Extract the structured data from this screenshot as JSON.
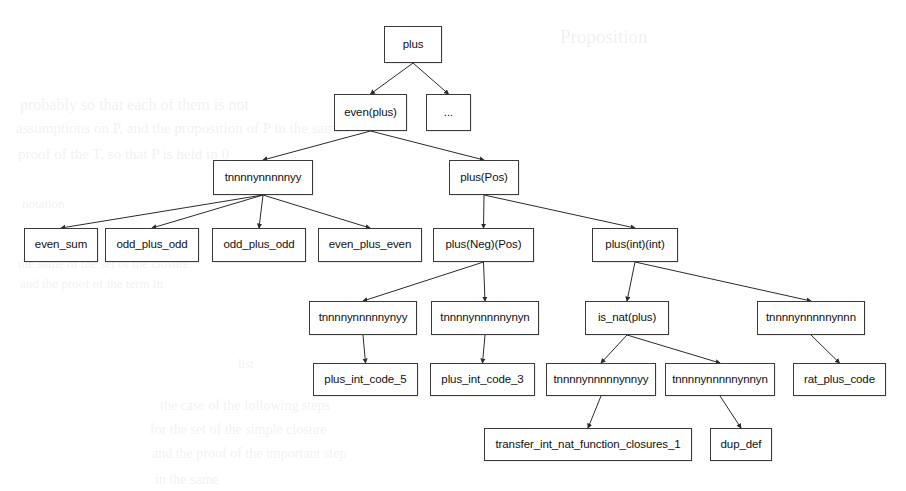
{
  "diagram": {
    "type": "call-graph-tree",
    "background_color": "#ffffff",
    "node_border_color": "#3a3a3a",
    "node_fill_color": "#ffffff",
    "text_color": "#111111",
    "edge_color": "#2b2b2b"
  },
  "nodes": [
    {
      "id": "plus",
      "label": "plus",
      "x": 384,
      "y": 26,
      "w": 58,
      "h": 37
    },
    {
      "id": "even_plus",
      "label": "even(plus)",
      "x": 334,
      "y": 94,
      "w": 73,
      "h": 37
    },
    {
      "id": "ellipsis",
      "label": "...",
      "x": 426,
      "y": 94,
      "w": 45,
      "h": 37
    },
    {
      "id": "t_a",
      "label": "tnnnnynnnnnyy",
      "x": 213,
      "y": 160,
      "w": 100,
      "h": 35
    },
    {
      "id": "plus_pos",
      "label": "plus(Pos)",
      "x": 449,
      "y": 160,
      "w": 70,
      "h": 35
    },
    {
      "id": "even_sum",
      "label": "even_sum",
      "x": 24,
      "y": 228,
      "w": 74,
      "h": 34
    },
    {
      "id": "odd_plus_odd_1",
      "label": "odd_plus_odd",
      "x": 105,
      "y": 228,
      "w": 94,
      "h": 34
    },
    {
      "id": "odd_plus_odd_2",
      "label": "odd_plus_odd",
      "x": 212,
      "y": 228,
      "w": 94,
      "h": 34
    },
    {
      "id": "even_plus_even",
      "label": "even_plus_even",
      "x": 318,
      "y": 228,
      "w": 104,
      "h": 34
    },
    {
      "id": "plus_neg_pos",
      "label": "plus(Neg)(Pos)",
      "x": 433,
      "y": 228,
      "w": 101,
      "h": 34
    },
    {
      "id": "plus_int_int",
      "label": "plus(int)(int)",
      "x": 592,
      "y": 228,
      "w": 86,
      "h": 34
    },
    {
      "id": "t_b",
      "label": "tnnnnynnnnnynyy",
      "x": 309,
      "y": 301,
      "w": 108,
      "h": 34
    },
    {
      "id": "t_c",
      "label": "tnnnnynnnnnynyn",
      "x": 431,
      "y": 301,
      "w": 108,
      "h": 34
    },
    {
      "id": "is_nat_plus",
      "label": "is_nat(plus)",
      "x": 585,
      "y": 301,
      "w": 84,
      "h": 34
    },
    {
      "id": "t_d",
      "label": "tnnnnynnnnnynnn",
      "x": 757,
      "y": 301,
      "w": 108,
      "h": 34
    },
    {
      "id": "plus_int_code_5",
      "label": "plus_int_code_5",
      "x": 313,
      "y": 363,
      "w": 105,
      "h": 33
    },
    {
      "id": "plus_int_code_3",
      "label": "plus_int_code_3",
      "x": 430,
      "y": 363,
      "w": 105,
      "h": 33
    },
    {
      "id": "t_e",
      "label": "tnnnnynnnnnynnyy",
      "x": 546,
      "y": 363,
      "w": 110,
      "h": 33
    },
    {
      "id": "t_f",
      "label": "tnnnnynnnnnynnyn",
      "x": 665,
      "y": 363,
      "w": 110,
      "h": 33
    },
    {
      "id": "rat_plus_code",
      "label": "rat_plus_code",
      "x": 793,
      "y": 363,
      "w": 93,
      "h": 33
    },
    {
      "id": "transfer",
      "label": "transfer_int_nat_function_closures_1",
      "x": 484,
      "y": 428,
      "w": 208,
      "h": 33
    },
    {
      "id": "dup_def",
      "label": "dup_def",
      "x": 710,
      "y": 428,
      "w": 62,
      "h": 33
    }
  ],
  "edges": [
    {
      "from": "plus",
      "to": "even_plus"
    },
    {
      "from": "plus",
      "to": "ellipsis"
    },
    {
      "from": "even_plus",
      "to": "t_a"
    },
    {
      "from": "even_plus",
      "to": "plus_pos"
    },
    {
      "from": "t_a",
      "to": "even_sum"
    },
    {
      "from": "t_a",
      "to": "odd_plus_odd_1"
    },
    {
      "from": "t_a",
      "to": "odd_plus_odd_2"
    },
    {
      "from": "t_a",
      "to": "even_plus_even"
    },
    {
      "from": "plus_pos",
      "to": "plus_neg_pos"
    },
    {
      "from": "plus_pos",
      "to": "plus_int_int"
    },
    {
      "from": "plus_neg_pos",
      "to": "t_b"
    },
    {
      "from": "plus_neg_pos",
      "to": "t_c"
    },
    {
      "from": "plus_int_int",
      "to": "is_nat_plus"
    },
    {
      "from": "plus_int_int",
      "to": "t_d"
    },
    {
      "from": "t_b",
      "to": "plus_int_code_5"
    },
    {
      "from": "t_c",
      "to": "plus_int_code_3"
    },
    {
      "from": "is_nat_plus",
      "to": "t_e"
    },
    {
      "from": "is_nat_plus",
      "to": "t_f"
    },
    {
      "from": "t_d",
      "to": "rat_plus_code"
    },
    {
      "from": "t_e",
      "to": "transfer"
    },
    {
      "from": "t_f",
      "to": "dup_def"
    }
  ],
  "background_bleed": [
    {
      "text": "Proposition",
      "x": 560,
      "y": 26,
      "size": 19
    },
    {
      "text": "probably   so   that each   of   them   is   not",
      "x": 20,
      "y": 96,
      "size": 16
    },
    {
      "text": "assumptions   on  P,  and  the   proposition  of   P  in   the  same",
      "x": 16,
      "y": 120,
      "size": 15
    },
    {
      "text": "proof   of   the   T,   so   that   P   is   held   in   0",
      "x": 18,
      "y": 146,
      "size": 15
    },
    {
      "text": "notation",
      "x": 22,
      "y": 196,
      "size": 13
    },
    {
      "text": "the  same   of   the   set   of   the   closure",
      "x": 18,
      "y": 256,
      "size": 13
    },
    {
      "text": "and   the   proof   of   the   term   in",
      "x": 20,
      "y": 276,
      "size": 13
    },
    {
      "text": "list",
      "x": 238,
      "y": 356,
      "size": 13
    },
    {
      "text": "the   case   of   the   following   steps",
      "x": 160,
      "y": 398,
      "size": 14
    },
    {
      "text": "for   the   set   of   the   simple   closure",
      "x": 150,
      "y": 422,
      "size": 14
    },
    {
      "text": "and   the   proof   of   the   important   step",
      "x": 152,
      "y": 446,
      "size": 14
    },
    {
      "text": "in   the   same",
      "x": 155,
      "y": 472,
      "size": 14
    }
  ]
}
